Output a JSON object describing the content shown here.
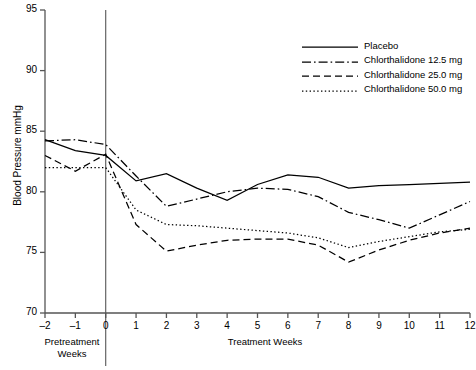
{
  "chart_data": {
    "type": "line",
    "title": "",
    "xlabel": "",
    "ylabel": "Blood Pressure mmHg",
    "xlim": [
      -2,
      12
    ],
    "ylim": [
      70,
      95
    ],
    "yticks": [
      70,
      75,
      80,
      85,
      90,
      95
    ],
    "xticks": [
      -2,
      -1,
      0,
      1,
      2,
      3,
      4,
      5,
      6,
      7,
      8,
      9,
      10,
      11,
      12
    ],
    "grid": false,
    "legend_position": "top-right",
    "x": [
      -2,
      -1,
      0,
      1,
      2,
      3,
      4,
      5,
      6,
      7,
      8,
      9,
      10,
      11,
      12
    ],
    "series": [
      {
        "name": "Placebo",
        "style": "solid",
        "values": [
          84.3,
          83.4,
          83.0,
          80.9,
          81.5,
          80.3,
          79.3,
          80.6,
          81.4,
          81.2,
          80.3,
          80.5,
          80.6,
          80.7,
          80.8
        ]
      },
      {
        "name": "Chlorthalidone 12.5 mg",
        "style": "dash-dot",
        "values": [
          84.2,
          84.3,
          83.9,
          81.3,
          78.8,
          79.4,
          80.0,
          80.3,
          80.2,
          79.6,
          78.3,
          77.7,
          77.0,
          78.1,
          79.2
        ]
      },
      {
        "name": "Chlorthalidone 25.0 mg",
        "style": "dashed",
        "values": [
          83.0,
          81.7,
          83.1,
          77.3,
          75.1,
          75.6,
          76.0,
          76.1,
          76.1,
          75.6,
          74.2,
          75.2,
          76.0,
          76.6,
          77.0
        ]
      },
      {
        "name": "Chlorthalidone 50.0 mg",
        "style": "dotted",
        "values": [
          82.0,
          82.0,
          82.0,
          78.5,
          77.3,
          77.2,
          77.0,
          76.8,
          76.6,
          76.2,
          75.4,
          75.9,
          76.3,
          76.7,
          76.9
        ]
      }
    ],
    "annotations": {
      "pretreatment_label": "Pretreatment\nWeeks",
      "treatment_label": "Treatment Weeks",
      "divider_x": 0
    }
  },
  "axis": {
    "ylabel": "Blood Pressure mmHg",
    "yticks": [
      "95",
      "90",
      "85",
      "80",
      "75",
      "70"
    ],
    "xticks": [
      "–2",
      "–1",
      "0",
      "1",
      "2",
      "3",
      "4",
      "5",
      "6",
      "7",
      "8",
      "9",
      "10",
      "11",
      "12"
    ]
  },
  "legend": {
    "items": [
      {
        "label": "Placebo",
        "style": "solid"
      },
      {
        "label": "Chlorthalidone 12.5 mg",
        "style": "dash-dot"
      },
      {
        "label": "Chlorthalidone 25.0 mg",
        "style": "dashed"
      },
      {
        "label": "Chlorthalidone 50.0 mg",
        "style": "dotted"
      }
    ]
  },
  "captions": {
    "pretreatment_line1": "Pretreatment",
    "pretreatment_line2": "Weeks",
    "treatment": "Treatment Weeks"
  },
  "colors": {
    "line": "#000000",
    "axis": "#555555",
    "background": "#ffffff"
  }
}
